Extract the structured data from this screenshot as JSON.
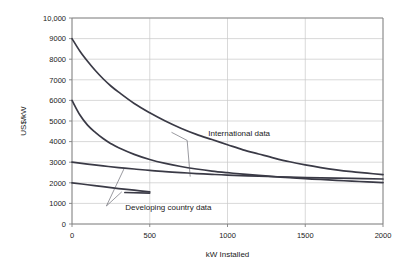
{
  "chart_data": {
    "type": "line",
    "title": "",
    "xlabel": "kW Installed",
    "ylabel": "US$/kW",
    "xlim": [
      0,
      2000
    ],
    "ylim": [
      0,
      10000
    ],
    "grid": true,
    "legend_position": "inline-annotations",
    "xticks": [
      "0",
      "500",
      "1000",
      "1500",
      "2000"
    ],
    "xtick_values": [
      0,
      500,
      1000,
      1500,
      2000
    ],
    "yticks": [
      "0",
      "1000",
      "2000",
      "3000",
      "4000",
      "5000",
      "6000",
      "7000",
      "8000",
      "9000",
      "10,000"
    ],
    "ytick_values": [
      0,
      1000,
      2000,
      3000,
      4000,
      5000,
      6000,
      7000,
      8000,
      9000,
      10000
    ],
    "annotations": [
      {
        "text": "International data",
        "x": 1075,
        "y": 4250
      },
      {
        "text": "Developing country data",
        "x": 620,
        "y": 680
      }
    ],
    "series": [
      {
        "name": "International data upper",
        "group": "International data",
        "x": [
          0,
          50,
          100,
          150,
          200,
          250,
          300,
          400,
          500,
          600,
          700,
          800,
          900,
          1000,
          1100,
          1200,
          1300,
          1400,
          1500,
          1600,
          1700,
          1800,
          1900,
          2000
        ],
        "values": [
          9000,
          8400,
          7900,
          7450,
          7050,
          6700,
          6400,
          5850,
          5400,
          5000,
          4650,
          4350,
          4100,
          3850,
          3600,
          3400,
          3200,
          3020,
          2870,
          2740,
          2630,
          2540,
          2465,
          2400
        ]
      },
      {
        "name": "International data lower",
        "group": "International data",
        "x": [
          0,
          50,
          100,
          150,
          200,
          250,
          300,
          400,
          500,
          600,
          700,
          800,
          900,
          1000,
          1100,
          1200,
          1300,
          1400,
          1500,
          1600,
          1700,
          1800,
          1900,
          2000
        ],
        "values": [
          6000,
          5300,
          4800,
          4450,
          4150,
          3900,
          3700,
          3380,
          3130,
          2940,
          2790,
          2670,
          2570,
          2490,
          2420,
          2360,
          2300,
          2250,
          2200,
          2160,
          2120,
          2080,
          2045,
          2010
        ]
      },
      {
        "name": "Developing country data upper",
        "group": "Developing country data",
        "x": [
          0,
          100,
          200,
          300,
          400,
          500,
          600,
          700,
          800,
          900,
          1000,
          1200,
          1400,
          1600,
          1800,
          2000
        ],
        "values": [
          3000,
          2910,
          2820,
          2740,
          2670,
          2600,
          2545,
          2495,
          2450,
          2410,
          2375,
          2320,
          2275,
          2240,
          2210,
          2185
        ]
      },
      {
        "name": "Developing country data lower",
        "group": "Developing country data",
        "x": [
          0,
          100,
          200,
          300,
          400,
          500
        ],
        "values": [
          2000,
          1905,
          1810,
          1720,
          1640,
          1560
        ]
      },
      {
        "name": "Developing country data short segment",
        "group": "Developing country data",
        "x": [
          340,
          500
        ],
        "values": [
          1530,
          1500
        ]
      }
    ],
    "colors": {
      "series_line": "#3a3a46",
      "gridline": "#c8c8c8",
      "axis": "#808080",
      "background": "#ffffff",
      "text": "#1a1a1a"
    }
  }
}
